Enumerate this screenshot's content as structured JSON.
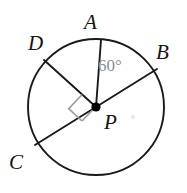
{
  "figure": {
    "kind": "circle-with-radii-geometry-diagram",
    "background_color": "#ffffff",
    "stroke_color": "#1a1a1a",
    "accent_gray": "#8e8e92",
    "center_dot_color": "#000000",
    "canvas": {
      "width": 187,
      "height": 193
    },
    "circle": {
      "cx": 96,
      "cy": 107,
      "r": 68,
      "stroke_width": 1.9
    },
    "center_point": {
      "name": "P",
      "x": 96,
      "y": 107,
      "dot_radius": 4.6
    }
  },
  "labels": {
    "A": "A",
    "B": "B",
    "C": "C",
    "D": "D",
    "P": "P",
    "angle": "60°"
  },
  "points": [
    {
      "name": "A",
      "x": 101,
      "y": 40,
      "angle_deg": 95,
      "on_circle": true
    },
    {
      "name": "B",
      "x": 157,
      "y": 69,
      "angle_deg": 34,
      "on_circle": true
    },
    {
      "name": "C",
      "x": 35,
      "y": 145,
      "angle_deg": 214,
      "on_circle": true
    },
    {
      "name": "D",
      "x": 44,
      "y": 60,
      "angle_deg": 141,
      "on_circle": true
    },
    {
      "name": "P",
      "x": 96,
      "y": 107,
      "angle_deg": null,
      "on_circle": false
    }
  ],
  "segments": [
    {
      "name": "PA",
      "from": "P",
      "to": "A",
      "type": "radius"
    },
    {
      "name": "PD",
      "from": "P",
      "to": "D",
      "type": "radius"
    },
    {
      "name": "BC",
      "from": "B",
      "to": "C",
      "type": "diameter"
    }
  ],
  "marks": {
    "right_angle": {
      "at": "P",
      "between": [
        "PD",
        "PC"
      ],
      "size": 19,
      "color": "#9a9a9e",
      "stroke_width": 1.6
    },
    "angle_arc": {
      "at": "P",
      "between": [
        "PA",
        "PB"
      ],
      "measure": "60°",
      "color": "#8e8e92"
    }
  }
}
